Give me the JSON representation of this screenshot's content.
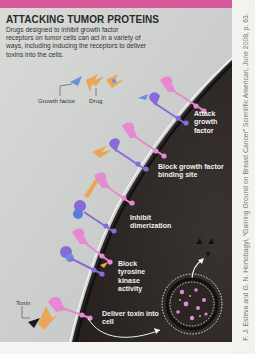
{
  "figure": {
    "title": "ATTACKING TUMOR PROTEINS",
    "caption": "Drugs designed to inhibit growth factor receptors on tumor cells can act in a variety of ways, including inducing the receptors to deliver toxins into the cells.",
    "legend": {
      "growth_factor": "Growth factor",
      "drug": "Drug",
      "toxin": "Toxin"
    },
    "steps": [
      {
        "label": "Attack growth factor"
      },
      {
        "label": "Block growth factor binding site"
      },
      {
        "label": "Inhibit dimerization"
      },
      {
        "label": "Block tyrosine kinase activity"
      },
      {
        "label": "Deliver toxin into cell"
      }
    ],
    "colors": {
      "top_bar": "#d85a9c",
      "cell_interior": "#2e2926",
      "extracellular": "#cfd2cf",
      "receptor_pink": "#e58ad0",
      "receptor_purple": "#8a6ad8",
      "drug_orange": "#e9a657",
      "growth_factor_blue": "#6a8fe0"
    }
  },
  "credit": "F. J. Esteva and G. N. Hortobagyi, “Gaining Ground on Breast Cancer” Scientific American, June 2008, p. 63."
}
